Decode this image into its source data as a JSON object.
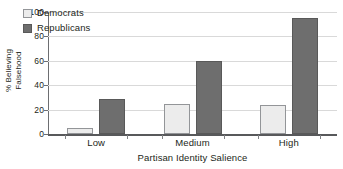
{
  "chart_data": {
    "type": "bar",
    "title": "",
    "xlabel": "Partisan Identity Salience",
    "ylabel_line1": "% Believing",
    "ylabel_line2": "Falsehood",
    "categories": [
      "Low",
      "Medium",
      "High"
    ],
    "series": [
      {
        "name": "Democrats",
        "values": [
          5,
          25,
          24
        ],
        "color": "#ececec"
      },
      {
        "name": "Republicans",
        "values": [
          29,
          60,
          95
        ],
        "color": "#6e6e6e"
      }
    ],
    "ylim": [
      0,
      100
    ],
    "yticks": [
      0,
      20,
      40,
      60,
      80,
      100
    ],
    "ytick_labels": [
      "0",
      "20",
      "40",
      "60",
      "80",
      "100"
    ],
    "grid": "horizontal",
    "legend_position": "upper-left-inside"
  }
}
